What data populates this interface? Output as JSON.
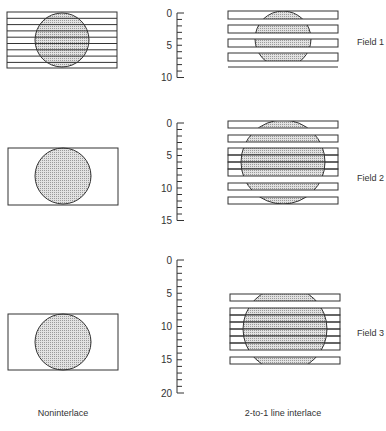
{
  "captions": {
    "left": "Noninterlace",
    "right": "2-to-1 line interlace"
  },
  "fields": [
    {
      "label": "Field 1",
      "ruler": {
        "min": 0,
        "max": 10,
        "tick_labels": [
          "0",
          "5",
          "10"
        ],
        "tick_values": [
          0,
          5,
          10
        ]
      }
    },
    {
      "label": "Field 2",
      "ruler": {
        "min": 0,
        "max": 15,
        "tick_labels": [
          "0",
          "5",
          "10",
          "15"
        ],
        "tick_values": [
          0,
          5,
          10,
          15
        ]
      }
    },
    {
      "label": "Field 3",
      "ruler": {
        "min": 0,
        "max": 20,
        "tick_labels": [
          "0",
          "5",
          "10",
          "15",
          "20"
        ],
        "tick_values": [
          0,
          5,
          10,
          15,
          20
        ]
      }
    }
  ],
  "colors": {
    "stroke": "#333333",
    "shade": "#d4d4d4",
    "background": "#ffffff"
  }
}
